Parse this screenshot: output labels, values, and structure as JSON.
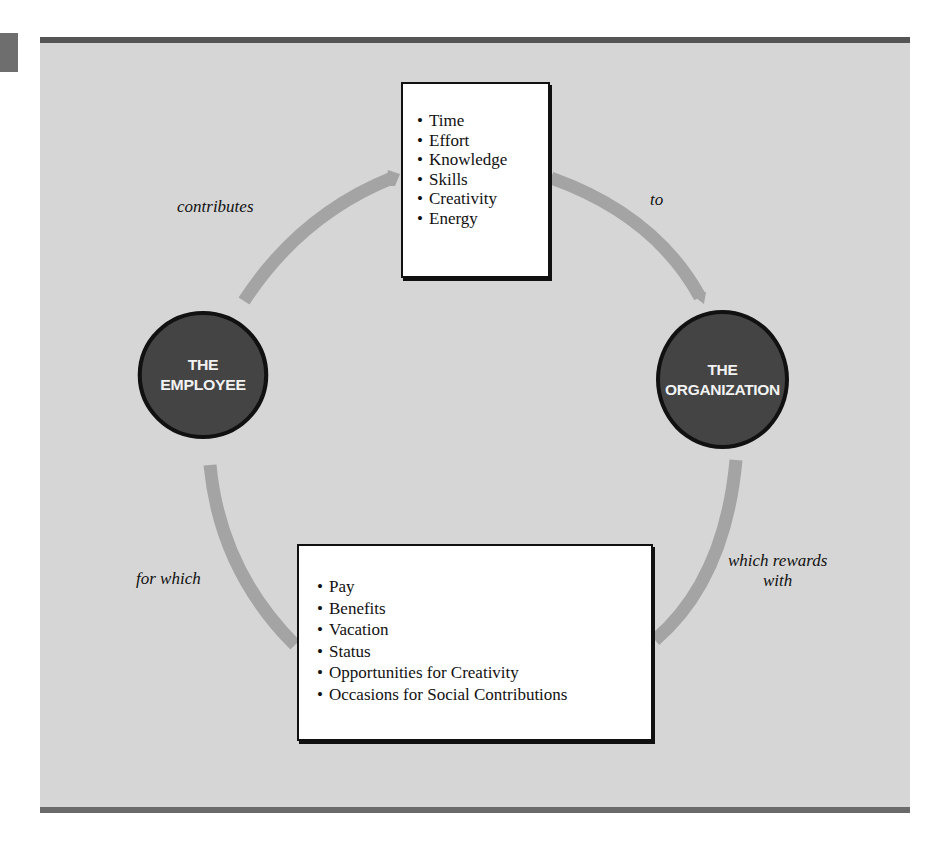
{
  "diagram": {
    "type": "cycle",
    "nodes": {
      "employee": {
        "line1": "THE",
        "line2": "EMPLOYEE"
      },
      "organization": {
        "line1": "THE",
        "line2": "ORGANIZATION"
      }
    },
    "contributions_box": {
      "items": [
        "Time",
        "Effort",
        "Knowledge",
        "Skills",
        "Creativity",
        "Energy"
      ]
    },
    "rewards_box": {
      "items": [
        "Pay",
        "Benefits",
        "Vacation",
        "Status",
        "Opportunities for Creativity",
        "Occasions for Social Contributions"
      ]
    },
    "edge_labels": {
      "contributes": "contributes",
      "to": "to",
      "which_rewards": "which rewards",
      "with": "with",
      "for_which": "for which"
    },
    "colors": {
      "panel_background": "#d6d6d6",
      "frame_bars": "#555555",
      "arrow": "#a4a4a4",
      "node_fill": "#444444",
      "node_text": "#f2f2f2",
      "box_fill": "#ffffff"
    }
  }
}
